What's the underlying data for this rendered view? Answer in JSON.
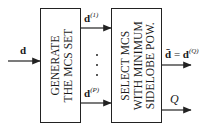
{
  "diagram": {
    "input": {
      "label": "d"
    },
    "block_generate": {
      "lines": [
        "GENERATE",
        "THE MCS SET"
      ]
    },
    "block_select": {
      "lines": [
        "SELECT MCS",
        "WITH MINIMUM",
        "SIDELOBE POW."
      ]
    },
    "intermediate_outputs": [
      {
        "base": "d",
        "superscript": "(1)"
      },
      {
        "base": "d",
        "superscript": "(P)"
      }
    ],
    "ellipsis": "⋮",
    "outputs": {
      "selected": {
        "lhs": "d̄",
        "equals": "=",
        "base": "d",
        "superscript": "(Q)"
      },
      "index": {
        "label": "Q"
      }
    },
    "colors": {
      "stroke": "#222222",
      "background": "#ffffff"
    }
  }
}
